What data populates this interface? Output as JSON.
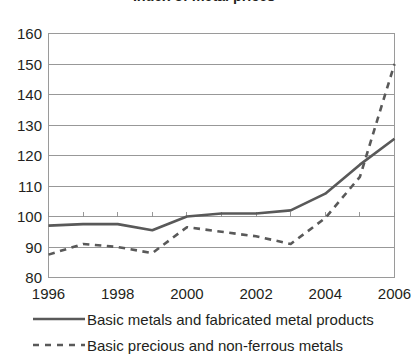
{
  "chart_data": {
    "type": "line",
    "title": "Index of metal prices",
    "title_cropped": true,
    "xlabel": "",
    "ylabel": "",
    "x": [
      1996,
      1997,
      1998,
      1999,
      2000,
      2001,
      2002,
      2003,
      2004,
      2005,
      2006
    ],
    "categories": [
      "1996",
      "1997",
      "1998",
      "1999",
      "2000",
      "2001",
      "2002",
      "2003",
      "2004",
      "2005",
      "2006"
    ],
    "xtick_labels": [
      "1996",
      "1998",
      "2000",
      "2002",
      "2004",
      "2006"
    ],
    "xtick_values": [
      1996,
      1998,
      2000,
      2002,
      2004,
      2006
    ],
    "ytick_labels": [
      "80",
      "90",
      "100",
      "110",
      "120",
      "130",
      "140",
      "150",
      "160"
    ],
    "ytick_values": [
      80,
      90,
      100,
      110,
      120,
      130,
      140,
      150,
      160
    ],
    "ylim": [
      80,
      160
    ],
    "xlim": [
      1996,
      2006
    ],
    "grid": "horizontal",
    "legend_position": "bottom-left",
    "series": [
      {
        "name": "Basic metals and fabricated metal products",
        "style": "solid",
        "color": "#595959",
        "values": [
          97.0,
          97.5,
          97.5,
          95.5,
          100.0,
          101.0,
          101.0,
          102.0,
          107.5,
          117.0,
          125.5
        ]
      },
      {
        "name": "Basic precious and non-ferrous metals",
        "style": "dashed",
        "color": "#595959",
        "values": [
          87.5,
          91.0,
          90.0,
          88.0,
          96.5,
          95.0,
          93.5,
          91.0,
          99.5,
          113.0,
          150.0
        ]
      }
    ]
  },
  "colors": {
    "axis": "#9a9a9a",
    "grid": "#8d8d8d",
    "series": "#595959",
    "text": "#231f20"
  }
}
